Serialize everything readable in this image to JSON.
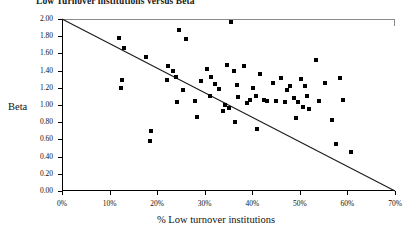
{
  "chart_data": {
    "type": "scatter",
    "title": "Low Turnover institutions versus Beta",
    "xlabel": "% Low turnover institutions",
    "ylabel": "Beta",
    "xlim": [
      0,
      70
    ],
    "ylim": [
      0,
      2.0
    ],
    "grid": false,
    "legend": null,
    "xticks": [
      0,
      10,
      20,
      30,
      40,
      50,
      60,
      70
    ],
    "xtick_labels": [
      "0%",
      "10%",
      "20%",
      "30%",
      "40%",
      "50%",
      "60%",
      "70%"
    ],
    "yticks": [
      0.0,
      0.2,
      0.4,
      0.6,
      0.8,
      1.0,
      1.2,
      1.4,
      1.6,
      1.8,
      2.0
    ],
    "ytick_labels": [
      "0.00",
      "0.20",
      "0.40",
      "0.60",
      "0.80",
      "1.00",
      "1.20",
      "1.40",
      "1.60",
      "1.80",
      "2.00"
    ],
    "annotations": [
      {
        "name": "diagonal-reference-line",
        "type": "line",
        "from": [
          0,
          2.0
        ],
        "to": [
          70,
          0.0
        ],
        "color": "#1a1a1a"
      }
    ],
    "series": [
      {
        "name": "institutions",
        "marker": "square",
        "color": "#000000",
        "points": [
          [
            11.9,
            1.78
          ],
          [
            13.1,
            1.66
          ],
          [
            12.6,
            1.29
          ],
          [
            12.4,
            1.2
          ],
          [
            17.6,
            1.56
          ],
          [
            18.7,
            0.7
          ],
          [
            18.4,
            0.58
          ],
          [
            22.2,
            1.45
          ],
          [
            24.5,
            1.87
          ],
          [
            26.0,
            1.77
          ],
          [
            23.3,
            1.39
          ],
          [
            24.0,
            1.33
          ],
          [
            22.0,
            1.29
          ],
          [
            25.4,
            1.18
          ],
          [
            24.2,
            1.04
          ],
          [
            27.9,
            1.05
          ],
          [
            28.4,
            0.86
          ],
          [
            30.5,
            1.42
          ],
          [
            31.4,
            1.33
          ],
          [
            29.3,
            1.28
          ],
          [
            32.1,
            1.24
          ],
          [
            33.0,
            1.19
          ],
          [
            31.2,
            1.1
          ],
          [
            34.6,
            1.47
          ],
          [
            35.6,
            1.96
          ],
          [
            36.2,
            1.4
          ],
          [
            34.3,
            1.0
          ],
          [
            35.0,
            0.97
          ],
          [
            33.8,
            0.93
          ],
          [
            36.8,
            1.23
          ],
          [
            38.2,
            1.45
          ],
          [
            37.1,
            1.09
          ],
          [
            36.4,
            0.8
          ],
          [
            39.6,
            1.06
          ],
          [
            38.9,
            1.02
          ],
          [
            40.2,
            1.2
          ],
          [
            41.6,
            1.36
          ],
          [
            40.8,
            1.1
          ],
          [
            42.4,
            1.06
          ],
          [
            43.1,
            1.05
          ],
          [
            41.0,
            0.72
          ],
          [
            44.3,
            1.26
          ],
          [
            45.0,
            1.05
          ],
          [
            46.1,
            1.31
          ],
          [
            46.9,
            1.03
          ],
          [
            48.0,
            1.22
          ],
          [
            47.4,
            1.18
          ],
          [
            48.8,
            1.08
          ],
          [
            49.6,
            1.04
          ],
          [
            50.3,
            1.3
          ],
          [
            51.0,
            1.22
          ],
          [
            51.4,
            1.1
          ],
          [
            50.6,
            0.98
          ],
          [
            52.0,
            0.95
          ],
          [
            49.1,
            0.85
          ],
          [
            53.4,
            1.52
          ],
          [
            55.2,
            1.26
          ],
          [
            54.0,
            1.05
          ],
          [
            56.8,
            0.82
          ],
          [
            58.4,
            1.31
          ],
          [
            59.0,
            1.06
          ],
          [
            57.6,
            0.55
          ],
          [
            60.8,
            0.45
          ]
        ]
      }
    ]
  }
}
